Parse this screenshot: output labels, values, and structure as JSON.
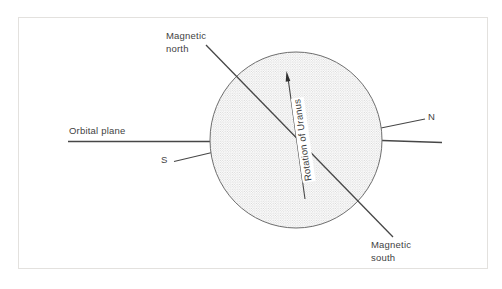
{
  "diagram": {
    "title_implied": "Orientation of the magnetic field of Uranus",
    "labels": {
      "magnetic_north": "Magnetic north",
      "orbital_plane": "Orbital plane",
      "south_pole": "S",
      "north_pole": "N",
      "rotation_axis": "Rotation of Uranus",
      "magnetic_south": "Magnetic south"
    },
    "icons": {
      "rotation_arrowhead": "arrow-up-icon"
    },
    "colors": {
      "background": "#ffffff",
      "frame_border": "#e3e1de",
      "line": "#474747",
      "text": "#3f3f3f",
      "circle_outline": "#6e6e6e",
      "stipple_dot": "#c2c2c2",
      "arrowhead": "#2f2f2f"
    }
  }
}
